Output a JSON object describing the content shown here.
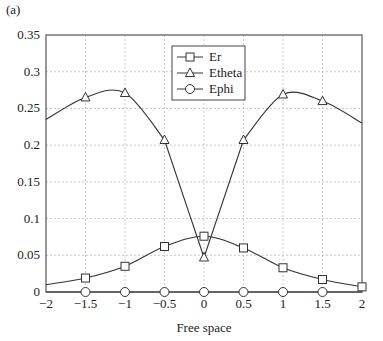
{
  "panel_label": "(a)",
  "chart_data": {
    "type": "line",
    "title": "",
    "xlabel": "Free space",
    "ylabel": "",
    "xlim": [
      -2,
      2
    ],
    "ylim": [
      0,
      0.35
    ],
    "grid": true,
    "legend_position": "upper center",
    "x_ticks": [
      "-2",
      "-1.5",
      "-1",
      "-0.5",
      "0",
      "0.5",
      "1",
      "1.5",
      "2"
    ],
    "y_ticks": [
      "0",
      "0.05",
      "0.1",
      "0.15",
      "0.2",
      "0.25",
      "0.3",
      "0.35"
    ],
    "x": [
      -2,
      -1.5,
      -1,
      -0.5,
      0,
      0.5,
      1,
      1.5,
      2
    ],
    "series": [
      {
        "name": "Er",
        "marker": "square",
        "values": [
          0.01,
          0.019,
          0.035,
          0.062,
          0.076,
          0.06,
          0.033,
          0.017,
          0.007
        ]
      },
      {
        "name": "Etheta",
        "marker": "triangle",
        "values": [
          0.235,
          0.265,
          0.271,
          0.207,
          0.047,
          0.207,
          0.269,
          0.26,
          0.23
        ]
      },
      {
        "name": "Ephi",
        "marker": "circle",
        "values": [
          0,
          0,
          0,
          0,
          0,
          0,
          0,
          0,
          0
        ]
      }
    ]
  }
}
